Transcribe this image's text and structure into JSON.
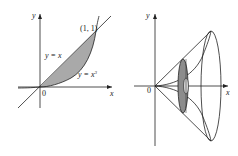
{
  "left_panel": {
    "y_axis_label": "y",
    "x_axis_label": "x",
    "origin_label": "0",
    "point_label": "(1, 1)",
    "curve1_label": "y = x",
    "curve2_label_base": "y = x",
    "curve2_label_exp": "3",
    "fill_color": "#a9a9a9"
  },
  "right_panel": {
    "y_axis_label": "y",
    "x_axis_label": "x",
    "origin_label": "0",
    "washer_color": "#8c8c8c"
  },
  "colors": {
    "line": "#222222",
    "background": "#ffffff"
  }
}
